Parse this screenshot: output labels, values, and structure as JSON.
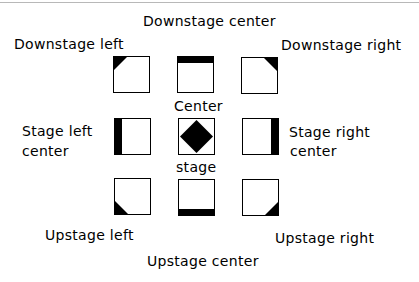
{
  "diagram": {
    "labels": {
      "downstage_center": "Downstage center",
      "downstage_left": "Downstage  left",
      "downstage_right": "Downstage right",
      "center": "Center",
      "stage": "stage",
      "stage_left_center_line1": "Stage left",
      "stage_left_center_line2": "center",
      "stage_right_center_line1": "Stage right",
      "stage_right_center_line2": "center",
      "upstage_left": "Upstage left",
      "upstage_center": "Upstage center",
      "upstage_right": "Upstage right"
    },
    "grid": [
      {
        "area": "downstage-left",
        "marker": "top-left-corner-triangle"
      },
      {
        "area": "downstage-center",
        "marker": "top-bar"
      },
      {
        "area": "downstage-right",
        "marker": "top-right-corner-triangle"
      },
      {
        "area": "stage-left-center",
        "marker": "left-bar"
      },
      {
        "area": "center-stage",
        "marker": "center-diamond"
      },
      {
        "area": "stage-right-center",
        "marker": "right-bar"
      },
      {
        "area": "upstage-left",
        "marker": "bottom-left-corner-triangle"
      },
      {
        "area": "upstage-center",
        "marker": "bottom-bar"
      },
      {
        "area": "upstage-right",
        "marker": "bottom-right-corner-triangle"
      }
    ],
    "colors": {
      "fill": "#000000",
      "background": "#ffffff",
      "rule": "#b8b8b8"
    }
  }
}
